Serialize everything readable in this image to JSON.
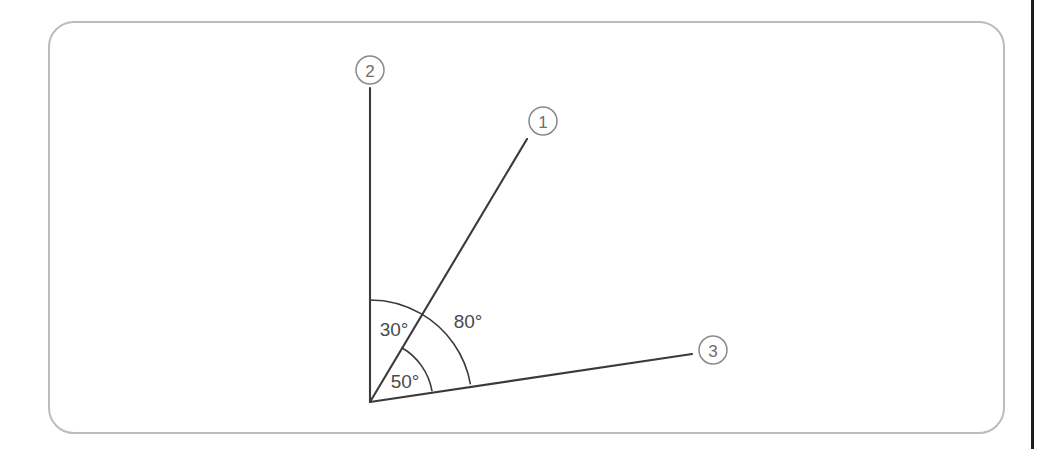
{
  "page": {
    "background_color": "#ffffff",
    "divider_color": "#1c1c1c"
  },
  "card": {
    "border_color": "#bcbcbc",
    "corner_radius": 26
  },
  "figure": {
    "type": "angle-diagram",
    "stroke_color": "#3a3a3a",
    "vertex": {
      "x": 370,
      "y": 402
    },
    "rays": [
      {
        "id": "ray-1",
        "label": "1",
        "angle_from_horizontal_deg": 60,
        "tip": {
          "x": 527,
          "y": 139
        },
        "label_circle": {
          "x": 543,
          "y": 121,
          "r": 14
        }
      },
      {
        "id": "ray-2",
        "label": "2",
        "angle_from_horizontal_deg": 90,
        "tip": {
          "x": 370,
          "y": 88
        },
        "label_circle": {
          "x": 370,
          "y": 70,
          "r": 14
        }
      },
      {
        "id": "ray-3",
        "label": "3",
        "angle_from_horizontal_deg": 10,
        "tip": {
          "x": 692,
          "y": 354
        },
        "label_circle": {
          "x": 713,
          "y": 350,
          "r": 14
        }
      }
    ],
    "angle_labels": [
      {
        "id": "angle-30",
        "text": "30°",
        "x": 394,
        "y": 329
      },
      {
        "id": "angle-80",
        "text": "80°",
        "x": 468,
        "y": 321
      },
      {
        "id": "angle-50",
        "text": "50°",
        "x": 405,
        "y": 381
      }
    ],
    "arcs": [
      {
        "id": "arc-30",
        "measure_deg": 30,
        "radius": 102,
        "between": [
          "ray-2",
          "ray-1"
        ],
        "start_deg": 60,
        "end_deg": 90
      },
      {
        "id": "arc-50",
        "measure_deg": 50,
        "radius": 63,
        "between": [
          "ray-3",
          "ray-1"
        ],
        "start_deg": 10,
        "end_deg": 60
      },
      {
        "id": "arc-80",
        "measure_deg": 80,
        "radius": 102,
        "between": [
          "ray-3",
          "ray-1"
        ],
        "start_deg": 10,
        "end_deg": 60
      }
    ]
  }
}
